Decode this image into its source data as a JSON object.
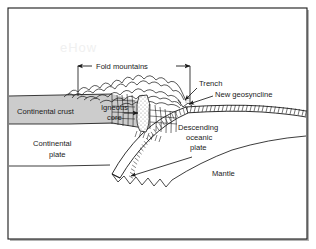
{
  "figure": {
    "watermark": "eHow",
    "frame": {
      "border_color": "#1a1a1a",
      "shadow_color": "#b4b4b4",
      "background": "#ffffff"
    },
    "colors": {
      "crust_fill": "#cccccc",
      "line": "#1a1a1a",
      "stipple": "#9a9a9a",
      "text": "#1a1a1a"
    }
  },
  "labels": {
    "fold_mountains": "Fold mountains",
    "trench": "Trench",
    "new_geosyncline": "New geosyncline",
    "continental_crust": "Continental crust",
    "igneous_core_line1": "Igneous",
    "igneous_core_line2": "core",
    "continental_plate_line1": "Continental",
    "continental_plate_line2": "plate",
    "descending_line1": "Descending",
    "descending_line2": "oceanic",
    "descending_line3": "plate",
    "mantle": "Mantle"
  },
  "annotations": {
    "fold_mountains_span": {
      "x_start": 78,
      "x_end": 190,
      "y": 66,
      "tick_bottom_left": 96,
      "tick_bottom_right": 103
    },
    "leaders": [
      {
        "name": "trench-leader",
        "from_x": 198,
        "from_y": 84,
        "to_x": 184,
        "to_y": 101
      },
      {
        "name": "new-geosyncline-leader",
        "from_x": 214,
        "from_y": 95,
        "to_x": 186,
        "to_y": 105
      },
      {
        "name": "igneous-core-arrow",
        "from_x": 124,
        "from_y": 113,
        "to_x": 137,
        "to_y": 113
      },
      {
        "name": "mantle-convection-arrow",
        "from_x": 190,
        "from_y": 158,
        "to_x": 130,
        "to_y": 177
      }
    ]
  }
}
